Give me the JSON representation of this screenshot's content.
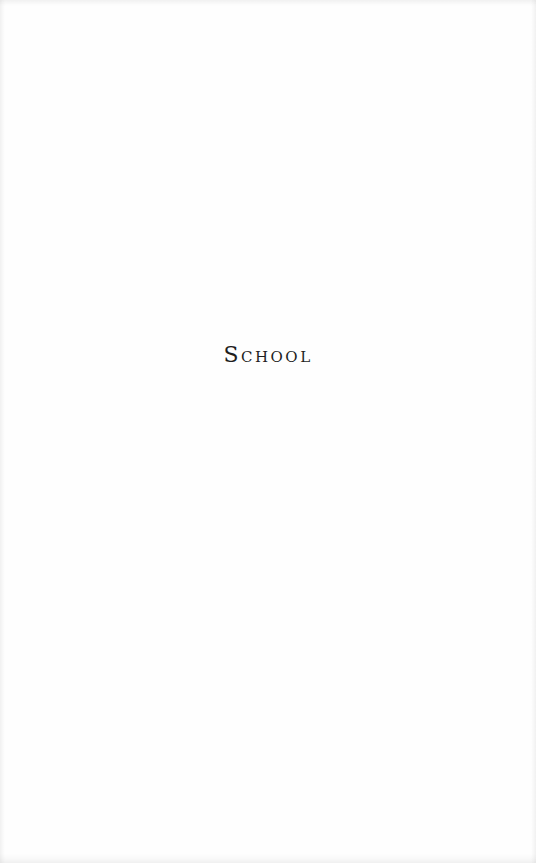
{
  "page": {
    "heading": "School",
    "background_color": "#fefefe",
    "text_color": "#1e1e1e"
  }
}
